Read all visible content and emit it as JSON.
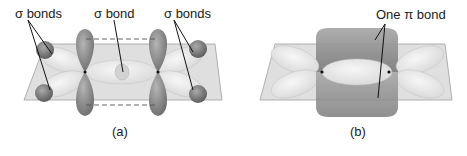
{
  "panel_a": {
    "label_left": "σ bonds",
    "label_center": "σ bond",
    "label_right": "σ bonds",
    "caption": "(a)"
  },
  "panel_b": {
    "label": "One π bond",
    "caption": "(b)"
  },
  "colors": {
    "plane": "#c9c9c9",
    "lobe_dark": "#8a8a8a",
    "lobe_light": "#e6e6e6",
    "h_atom": "#7a7a7a"
  }
}
